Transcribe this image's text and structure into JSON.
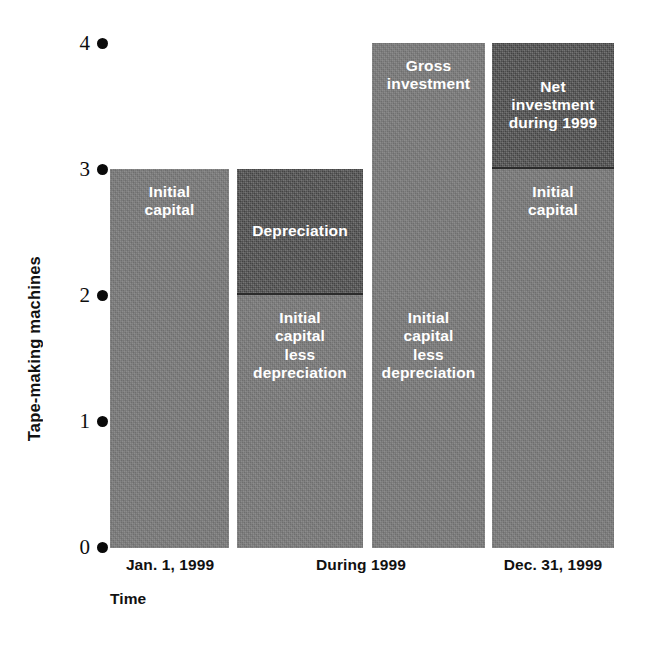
{
  "chart_data": {
    "type": "bar",
    "title": "",
    "subtitle": "",
    "xlabel": "Time",
    "ylabel": "Tape-making machines",
    "ylim": [
      0,
      4
    ],
    "yticks": [
      0,
      1,
      2,
      3,
      4
    ],
    "ytick_labels": [
      "0",
      "1",
      "2",
      "3",
      "4"
    ],
    "grid": false,
    "legend": "none",
    "stacked": true,
    "categories": [
      "Jan. 1, 1999",
      "During 1999",
      "Dec. 31, 1999"
    ],
    "bars": [
      {
        "name": "bar-initial",
        "category": "Jan. 1, 1999",
        "segments": [
          {
            "label": "Initial\ncapital",
            "y0": 0,
            "y1": 3,
            "value": 3,
            "shade": "light"
          }
        ]
      },
      {
        "name": "bar-depreciation",
        "category": "During 1999",
        "segments": [
          {
            "label": "Initial\ncapital\nless\ndepreciation",
            "y0": 0,
            "y1": 2,
            "value": 2,
            "shade": "light"
          },
          {
            "label": "Depreciation",
            "y0": 2,
            "y1": 3,
            "value": 1,
            "shade": "dark"
          }
        ]
      },
      {
        "name": "bar-gross-investment",
        "category": "During 1999",
        "segments": [
          {
            "label": "Initial\ncapital\nless\ndepreciation",
            "y0": 0,
            "y1": 2,
            "value": 2,
            "shade": "light"
          },
          {
            "label": "Gross\ninvestment",
            "y0": 2,
            "y1": 4,
            "value": 2,
            "shade": "light"
          }
        ]
      },
      {
        "name": "bar-net-investment",
        "category": "Dec. 31, 1999",
        "segments": [
          {
            "label": "Initial\ncapital",
            "y0": 0,
            "y1": 3,
            "value": 3,
            "shade": "light"
          },
          {
            "label": "Net\ninvestment\nduring 1999",
            "y0": 3,
            "y1": 4,
            "value": 1,
            "shade": "dark"
          }
        ]
      }
    ],
    "colors": {
      "bar_light": "#7d7d7d",
      "bar_dark": "#565656",
      "axis_text": "#111111",
      "segment_text": "#ffffff",
      "background": "#ffffff"
    }
  },
  "axes": {
    "y": {
      "title": "Tape-making machines",
      "ticks": [
        {
          "label": "4"
        },
        {
          "label": "3"
        },
        {
          "label": "2"
        },
        {
          "label": "1"
        },
        {
          "label": "0"
        }
      ]
    },
    "x": {
      "title": "Time",
      "labels": [
        {
          "text": "Jan. 1, 1999"
        },
        {
          "text": "During 1999"
        },
        {
          "text": "Dec. 31, 1999"
        }
      ]
    }
  }
}
